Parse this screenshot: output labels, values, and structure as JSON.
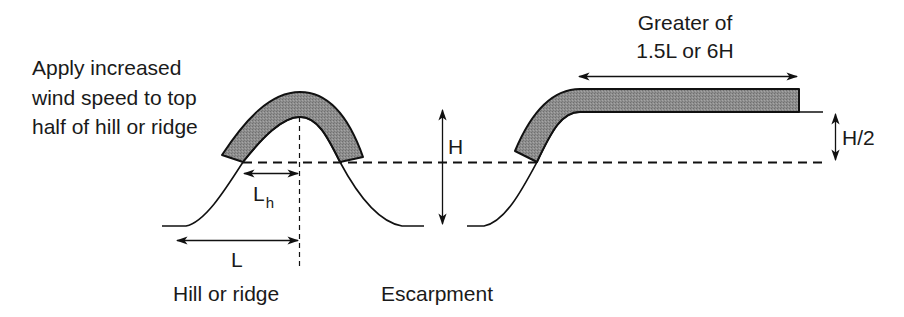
{
  "diagram": {
    "type": "wind-speed-topography-diagram",
    "colors": {
      "line": "#111111",
      "shaded_band": "#8a8a8a",
      "background": "#ffffff"
    },
    "note": {
      "lines": [
        "Apply increased",
        "wind speed to top",
        "half of hill or ridge"
      ]
    },
    "hill": {
      "caption": "Hill or ridge",
      "dim_Lh": {
        "main": "L",
        "subscript": "h"
      },
      "dim_L": "L",
      "dim_H": "H"
    },
    "escarpment": {
      "caption": "Escarpment",
      "extent_label": [
        "Greater of",
        "1.5L or 6H"
      ],
      "dim_half_H": "H/2"
    }
  }
}
